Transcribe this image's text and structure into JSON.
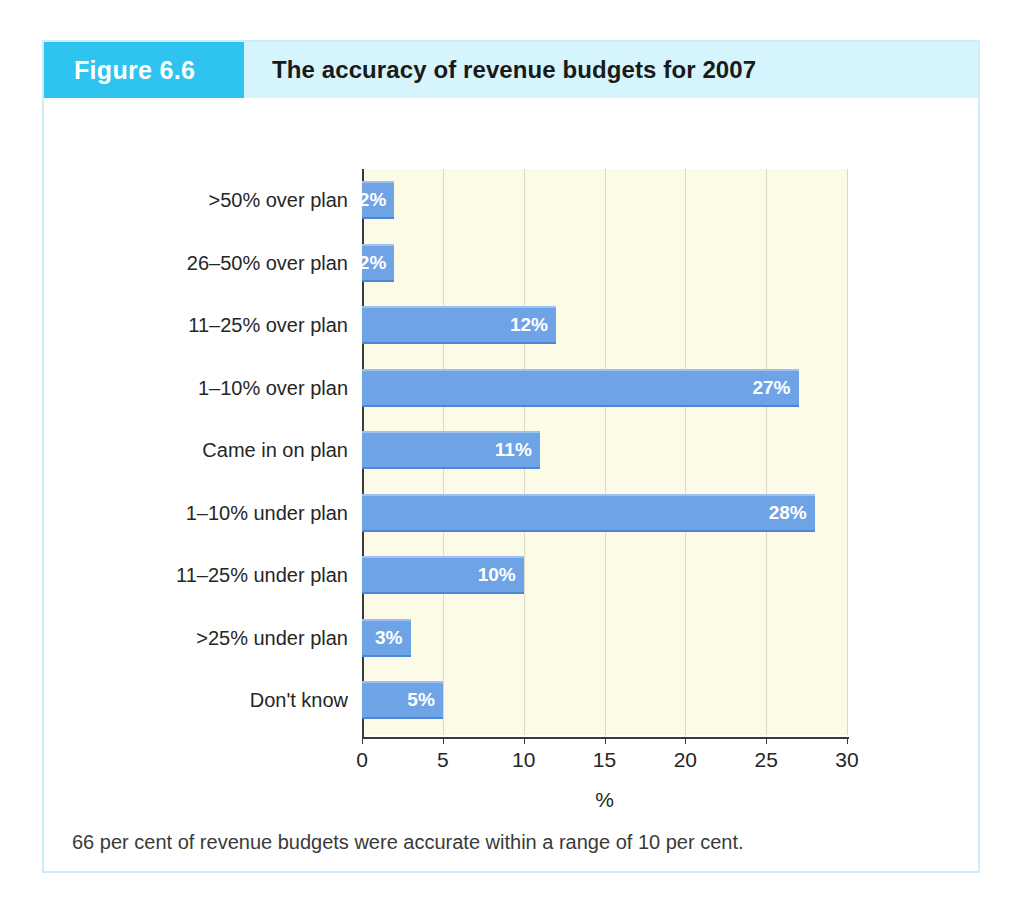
{
  "figure": {
    "tag": "Figure 6.6",
    "title": "The accuracy of revenue budgets for 2007",
    "note": "66 per cent of revenue budgets were accurate within a range of 10 per cent.",
    "tag_bg": "#2ec4ef",
    "header_bg": "#d6f4fb",
    "border_color": "#c9eef7"
  },
  "chart_data": {
    "type": "bar",
    "orientation": "horizontal",
    "title": "The accuracy of revenue budgets for 2007",
    "xlabel": "%",
    "ylabel": "",
    "xlim": [
      0,
      30
    ],
    "xticks": [
      0,
      5,
      10,
      15,
      20,
      25,
      30
    ],
    "xtick_labels": [
      "0",
      "5",
      "10",
      "15",
      "20",
      "25",
      "30"
    ],
    "grid": true,
    "legend": "none",
    "plot_bg": "#fbfbe8",
    "bar_color": "#6ea3e6",
    "categories": [
      ">50% over plan",
      "26–50% over plan",
      "11–25% over plan",
      "1–10% over plan",
      "Came in on plan",
      "1–10% under plan",
      "11–25% under plan",
      ">25% under plan",
      "Don't know"
    ],
    "values": [
      2,
      2,
      12,
      27,
      11,
      28,
      10,
      3,
      5
    ],
    "data_labels": [
      "2%",
      "2%",
      "12%",
      "27%",
      "11%",
      "28%",
      "10%",
      "3%",
      "5%"
    ],
    "annotation": "66 per cent of revenue budgets were accurate within a range of 10 per cent."
  }
}
